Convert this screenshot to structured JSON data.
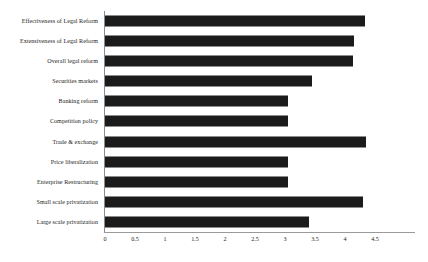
{
  "chart_data": {
    "type": "bar",
    "orientation": "horizontal",
    "title": "",
    "xlabel": "",
    "ylabel": "",
    "xlim": [
      0,
      4.75
    ],
    "xticks": [
      "0",
      "0.5",
      "1",
      "1.5",
      "2",
      "2.5",
      "3",
      "3.5",
      "4",
      "4.5"
    ],
    "xtick_values": [
      0,
      0.5,
      1,
      1.5,
      2,
      2.5,
      3,
      3.5,
      4,
      4.5
    ],
    "grid": false,
    "legend": "none",
    "bar_color": "#1b1b1b",
    "axis_color": "#8c8c8c",
    "categories": [
      "Effectiveness of Legal Reform",
      "Extensiveness of Legal Reform",
      "Overall legal reform",
      "Securities markets",
      "Banking reform",
      "Competition policy",
      "Trade & exchange",
      "Price liberalization",
      "Enterprise Restructuring",
      "Small scale privatization",
      "Large scale privatization"
    ],
    "values": [
      4.33,
      4.15,
      4.13,
      3.45,
      3.05,
      3.05,
      4.35,
      3.05,
      3.05,
      4.3,
      3.4
    ]
  }
}
